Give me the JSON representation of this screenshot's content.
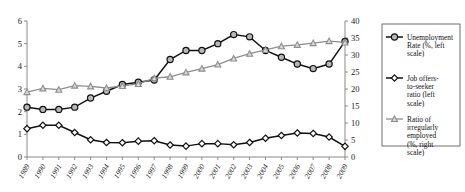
{
  "chart_data": {
    "type": "line",
    "title": "",
    "xlabel": "",
    "ylabel": "",
    "grid": false,
    "legend_position": "right",
    "categories": [
      "1989",
      "1990",
      "1991",
      "1992",
      "1993",
      "1994",
      "1995",
      "1996",
      "1997",
      "1998",
      "1999",
      "2000",
      "2001",
      "2002",
      "2003",
      "2004",
      "2005",
      "2006",
      "2007",
      "2008",
      "2009"
    ],
    "left_axis": {
      "label": "",
      "min": 0,
      "max": 6,
      "step": 1,
      "ticks": [
        "0",
        "1",
        "2",
        "3",
        "4",
        "5",
        "6"
      ]
    },
    "right_axis": {
      "label": "",
      "min": 0,
      "max": 40,
      "step": 5,
      "ticks": [
        "0",
        "5",
        "10",
        "15",
        "20",
        "25",
        "30",
        "35",
        "40"
      ]
    },
    "series": [
      {
        "name": "Unemployment Rate (%, left scale)",
        "legend_label": "Unemployment Rate (%, left scale)",
        "axis": "left",
        "marker": "circle-filled",
        "color": "#111111",
        "values": [
          2.2,
          2.1,
          2.1,
          2.2,
          2.6,
          2.9,
          3.2,
          3.3,
          3.4,
          4.3,
          4.7,
          4.7,
          5.0,
          5.4,
          5.3,
          4.7,
          4.4,
          4.1,
          3.9,
          4.1,
          5.1
        ]
      },
      {
        "name": "Job offers-to-seeker ratio (left scale)",
        "legend_label": "Job offers-to-seeker ratio (left scale)",
        "axis": "left",
        "marker": "diamond-open",
        "color": "#111111",
        "values": [
          1.25,
          1.4,
          1.4,
          1.08,
          0.76,
          0.64,
          0.63,
          0.7,
          0.72,
          0.53,
          0.48,
          0.59,
          0.59,
          0.54,
          0.64,
          0.83,
          0.95,
          1.06,
          1.04,
          0.88,
          0.47
        ]
      },
      {
        "name": "Ratio of irregularly employed (%, right scale)",
        "legend_label": "Ratio of irregularly employed (%, right scale)",
        "axis": "right",
        "marker": "triangle",
        "color": "#8d8d8d",
        "values": [
          19.1,
          20.2,
          19.8,
          21.0,
          20.8,
          20.3,
          20.9,
          21.5,
          23.2,
          23.6,
          24.9,
          26.0,
          27.2,
          29.0,
          30.4,
          31.5,
          32.6,
          33.0,
          33.5,
          34.1,
          33.7
        ]
      }
    ]
  }
}
